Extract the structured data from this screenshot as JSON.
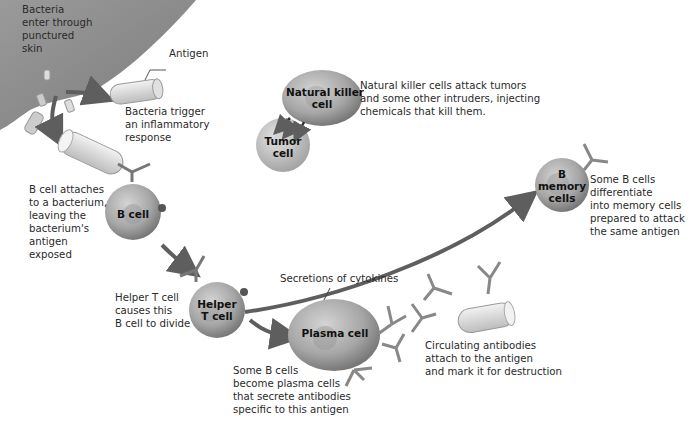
{
  "diagram": {
    "type": "immune response flow",
    "labels": {
      "bacteria_enter": [
        "Bacteria",
        "enter through",
        "punctured",
        "skin"
      ],
      "antigen": "Antigen",
      "bacteria_trigger": [
        "Bacteria trigger",
        "an inflammatory",
        "response"
      ],
      "nk_desc": [
        "Natural killer cells attack tumors",
        "and some other intruders, injecting",
        "chemicals that kill them."
      ],
      "bcell_attaches": [
        "B cell attaches",
        "to a bacterium,",
        "leaving the",
        "bacterium's",
        "antigen",
        "exposed"
      ],
      "helper_desc": [
        "Helper T cell",
        "causes this",
        "B cell to divide"
      ],
      "cytokines": "Secretions of cytokines",
      "plasma_desc": [
        "Some B cells",
        "become plasma cells",
        "that secrete antibodies",
        "specific to this antigen"
      ],
      "circulating": [
        "Circulating antibodies",
        "attach to the antigen",
        "and mark it for destruction"
      ],
      "memory_desc": [
        "Some B cells",
        "differentiate",
        "into memory cells",
        "prepared to attack",
        "the same antigen"
      ]
    },
    "cells": {
      "nk": [
        "Natural killer",
        "cell"
      ],
      "tumor": [
        "Tumor",
        "cell"
      ],
      "bcell": "B cell",
      "helper": [
        "Helper",
        "T cell"
      ],
      "plasma": "Plasma cell",
      "memory": [
        "B",
        "memory",
        "cells"
      ]
    },
    "colors": {
      "cell_fill": "#a8a8a8",
      "cell_dark": "#7a7a7a",
      "arrow": "#5e5e5e",
      "skin": "#8c8c8c"
    }
  }
}
